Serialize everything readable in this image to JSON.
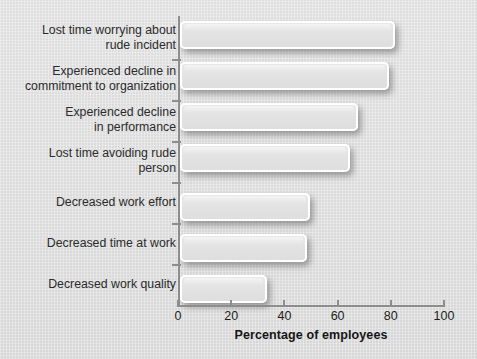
{
  "chart_data": {
    "type": "bar",
    "orientation": "horizontal",
    "title": "",
    "xlabel": "Percentage of employees",
    "ylabel": "",
    "xlim": [
      0,
      100
    ],
    "xticks": [
      0,
      20,
      40,
      60,
      80,
      100
    ],
    "xtick_labels": [
      "0",
      "20",
      "40",
      "60",
      "80",
      "100"
    ],
    "grid": false,
    "legend": null,
    "categories": [
      "Lost time worrying about\nrude incident",
      "Experienced decline in\ncommitment to organization",
      "Experienced decline\nin performance",
      "Lost time avoiding rude\nperson",
      "Decreased work effort",
      "Decreased time at work",
      "Decreased work quality"
    ],
    "values": [
      80,
      78,
      66,
      63,
      48,
      47,
      32
    ],
    "colors": {
      "background": "#e0e0e0",
      "bar_fill": "#e4e4e4",
      "bar_border": "#ffffff",
      "axis": "#8d8d8d",
      "label_text": "#2b2b2b",
      "title_text": "#151515"
    }
  }
}
